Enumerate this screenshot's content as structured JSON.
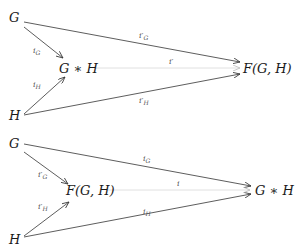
{
  "diagrams": [
    {
      "id": "top",
      "nodes": {
        "G": {
          "label": "G"
        },
        "H": {
          "label": "H"
        },
        "center": {
          "label": "G ∗ H"
        },
        "target": {
          "label": "F(G, H)"
        }
      },
      "edges": [
        {
          "from": "G",
          "to": "center",
          "label": "i",
          "sub": "G",
          "prime": false
        },
        {
          "from": "H",
          "to": "center",
          "label": "i",
          "sub": "H",
          "prime": false
        },
        {
          "from": "G",
          "to": "target",
          "label": "i′",
          "sub": "G",
          "prime": true
        },
        {
          "from": "H",
          "to": "target",
          "label": "i′",
          "sub": "H",
          "prime": true
        },
        {
          "from": "center",
          "to": "target",
          "label": "i′",
          "sub": "",
          "prime": true,
          "style": "faint"
        }
      ]
    },
    {
      "id": "bottom",
      "nodes": {
        "G": {
          "label": "G"
        },
        "H": {
          "label": "H"
        },
        "center": {
          "label": "F(G, H)"
        },
        "target": {
          "label": "G ∗ H"
        }
      },
      "edges": [
        {
          "from": "G",
          "to": "center",
          "label": "i′",
          "sub": "G",
          "prime": true
        },
        {
          "from": "H",
          "to": "center",
          "label": "i′",
          "sub": "H",
          "prime": true
        },
        {
          "from": "G",
          "to": "target",
          "label": "i",
          "sub": "G",
          "prime": false
        },
        {
          "from": "H",
          "to": "target",
          "label": "i",
          "sub": "H",
          "prime": false
        },
        {
          "from": "center",
          "to": "target",
          "label": "i",
          "sub": "",
          "prime": false,
          "style": "faint"
        }
      ]
    }
  ],
  "colors": {
    "edge": "#333333",
    "faint_edge": "#dcdcdc",
    "label": "#555555",
    "node": "#1a1a1a"
  }
}
